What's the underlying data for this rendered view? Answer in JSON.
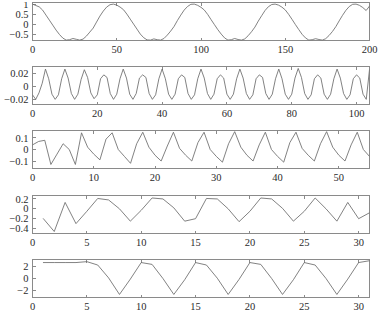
{
  "figure": {
    "title": "",
    "background_color": "#ffffff",
    "line_color": "#6b6b6b",
    "axis_color": "#8a8a8a",
    "subplot_count": 5
  },
  "chart_data": [
    {
      "type": "line",
      "title": "",
      "xlabel": "",
      "ylabel": "",
      "grid": false,
      "legend": null,
      "xlim": [
        0,
        200
      ],
      "ylim": [
        -0.82,
        1.08
      ],
      "xticks": [
        0,
        50,
        100,
        150,
        200
      ],
      "xticklabels": [
        "0",
        "50",
        "100",
        "150",
        "200"
      ],
      "yticks": [
        1,
        0.5,
        0,
        -0.5
      ],
      "yticklabels": [
        "1",
        "0.5",
        "0",
        "-0.5"
      ],
      "x": [
        0,
        2,
        4,
        6,
        8,
        10,
        12,
        14,
        16,
        18,
        20,
        22,
        24,
        26,
        28,
        30,
        32,
        34,
        36,
        38,
        40,
        42,
        44,
        46,
        48,
        50,
        52,
        54,
        56,
        58,
        60,
        62,
        64,
        66,
        68,
        70,
        72,
        74,
        76,
        78,
        80,
        82,
        84,
        86,
        88,
        90,
        92,
        94,
        96,
        98,
        100,
        102,
        104,
        106,
        108,
        110,
        112,
        114,
        116,
        118,
        120,
        122,
        124,
        126,
        128,
        130,
        132,
        134,
        136,
        138,
        140,
        142,
        144,
        146,
        148,
        150,
        152,
        154,
        156,
        158,
        160,
        162,
        164,
        166,
        168,
        170,
        172,
        174,
        176,
        178,
        180,
        182,
        184,
        186,
        188,
        190,
        192,
        194,
        196,
        198,
        200
      ],
      "values": [
        1.0,
        0.93,
        0.86,
        0.7,
        0.45,
        0.2,
        -0.05,
        -0.3,
        -0.52,
        -0.7,
        -0.8,
        -0.78,
        -0.72,
        -0.76,
        -0.8,
        -0.75,
        -0.6,
        -0.4,
        -0.2,
        0.1,
        0.4,
        0.65,
        0.85,
        0.97,
        1.0,
        0.95,
        0.85,
        0.72,
        0.5,
        0.25,
        0.0,
        -0.25,
        -0.5,
        -0.68,
        -0.79,
        -0.8,
        -0.74,
        -0.78,
        -0.8,
        -0.72,
        -0.55,
        -0.35,
        -0.12,
        0.18,
        0.45,
        0.7,
        0.88,
        0.99,
        1.0,
        0.94,
        0.84,
        0.7,
        0.48,
        0.22,
        -0.03,
        -0.28,
        -0.5,
        -0.69,
        -0.8,
        -0.78,
        -0.72,
        -0.77,
        -0.8,
        -0.74,
        -0.58,
        -0.38,
        -0.15,
        0.15,
        0.42,
        0.68,
        0.87,
        0.98,
        1.0,
        0.95,
        0.85,
        0.71,
        0.49,
        0.24,
        -0.02,
        -0.27,
        -0.51,
        -0.69,
        -0.8,
        -0.78,
        -0.73,
        -0.77,
        -0.8,
        -0.73,
        -0.57,
        -0.37,
        -0.13,
        0.16,
        0.44,
        0.69,
        0.88,
        0.99,
        1.0,
        0.94,
        0.83,
        0.68,
        0.9
      ]
    },
    {
      "type": "line",
      "title": "",
      "xlabel": "",
      "ylabel": "",
      "grid": false,
      "legend": null,
      "xlim": [
        0,
        104
      ],
      "ylim": [
        -0.028,
        0.031
      ],
      "xticks": [
        0,
        20,
        40,
        60,
        80,
        100
      ],
      "xticklabels": [
        "0",
        "20",
        "40",
        "60",
        "80",
        "100"
      ],
      "yticks": [
        0.02,
        0,
        -0.02
      ],
      "yticklabels": [
        "0.02",
        "0",
        "-0.02"
      ],
      "x": [
        0,
        1,
        2,
        3,
        4,
        5,
        6,
        7,
        8,
        9,
        10,
        11,
        12,
        13,
        14,
        15,
        16,
        17,
        18,
        19,
        20,
        21,
        22,
        23,
        24,
        25,
        26,
        27,
        28,
        29,
        30,
        31,
        32,
        33,
        34,
        35,
        36,
        37,
        38,
        39,
        40,
        41,
        42,
        43,
        44,
        45,
        46,
        47,
        48,
        49,
        50,
        51,
        52,
        53,
        54,
        55,
        56,
        57,
        58,
        59,
        60,
        61,
        62,
        63,
        64,
        65,
        66,
        67,
        68,
        69,
        70,
        71,
        72,
        73,
        74,
        75,
        76,
        77,
        78,
        79,
        80,
        81,
        82,
        83,
        84,
        85,
        86,
        87,
        88,
        89,
        90,
        91,
        92,
        93,
        94,
        95,
        96,
        97,
        98,
        99,
        100,
        101,
        102,
        103,
        104
      ],
      "values": [
        -0.013,
        -0.02,
        -0.01,
        0.005,
        0.027,
        0.012,
        -0.012,
        -0.02,
        -0.013,
        0.012,
        0.027,
        0.013,
        -0.011,
        -0.02,
        -0.012,
        0.011,
        0.026,
        0.014,
        -0.01,
        -0.019,
        -0.013,
        0.012,
        0.018,
        0.014,
        -0.011,
        -0.02,
        -0.012,
        0.012,
        0.027,
        0.013,
        -0.012,
        -0.02,
        -0.011,
        0.013,
        0.018,
        0.014,
        -0.011,
        -0.02,
        -0.013,
        0.012,
        0.027,
        0.012,
        -0.012,
        -0.02,
        -0.012,
        0.012,
        0.018,
        0.014,
        -0.011,
        -0.02,
        -0.013,
        0.012,
        0.027,
        0.013,
        -0.011,
        -0.02,
        -0.012,
        0.012,
        0.018,
        0.013,
        -0.012,
        -0.02,
        -0.012,
        0.012,
        0.027,
        0.013,
        -0.011,
        -0.02,
        -0.013,
        0.012,
        0.018,
        0.014,
        -0.011,
        -0.02,
        -0.012,
        0.012,
        0.027,
        0.012,
        -0.012,
        -0.02,
        -0.012,
        0.013,
        0.028,
        0.014,
        -0.011,
        -0.02,
        -0.013,
        0.012,
        0.018,
        0.013,
        -0.012,
        -0.02,
        -0.012,
        0.012,
        0.027,
        0.013,
        -0.011,
        -0.02,
        -0.013,
        0.012,
        0.018,
        0.013,
        -0.012,
        -0.02,
        0.026
      ]
    },
    {
      "type": "line",
      "title": "",
      "xlabel": "",
      "ylabel": "",
      "grid": false,
      "legend": null,
      "xlim": [
        0,
        55
      ],
      "ylim": [
        -0.165,
        0.165
      ],
      "xticks": [
        0,
        10,
        20,
        30,
        40,
        50
      ],
      "xticklabels": [
        "0",
        "10",
        "20",
        "30",
        "40",
        "50"
      ],
      "yticks": [
        0.1,
        0,
        -0.1
      ],
      "yticklabels": [
        "0.1",
        "0",
        "-0.1"
      ],
      "x": [
        0,
        1,
        2,
        3,
        4,
        5,
        6,
        7,
        8,
        9,
        10,
        11,
        12,
        13,
        14,
        15,
        16,
        17,
        18,
        19,
        20,
        21,
        22,
        23,
        24,
        25,
        26,
        27,
        28,
        29,
        30,
        31,
        32,
        33,
        34,
        35,
        36,
        37,
        38,
        39,
        40,
        41,
        42,
        43,
        44,
        45,
        46,
        47,
        48,
        49,
        50,
        51,
        52,
        53,
        54,
        55
      ],
      "values": [
        0.04,
        0.07,
        0.08,
        -0.13,
        -0.04,
        0.05,
        0.0,
        -0.13,
        0.145,
        0.02,
        -0.04,
        -0.09,
        0.09,
        0.145,
        0.0,
        -0.06,
        -0.12,
        0.05,
        0.15,
        0.02,
        -0.05,
        -0.1,
        0.03,
        0.15,
        0.01,
        -0.05,
        -0.1,
        0.06,
        0.15,
        0.0,
        -0.06,
        -0.11,
        0.05,
        0.155,
        0.02,
        -0.05,
        -0.1,
        0.04,
        0.15,
        0.0,
        -0.06,
        -0.11,
        0.06,
        0.15,
        0.01,
        -0.05,
        -0.1,
        0.05,
        0.155,
        0.02,
        -0.05,
        -0.1,
        0.04,
        0.15,
        0.0,
        -0.06
      ]
    },
    {
      "type": "line",
      "title": "",
      "xlabel": "",
      "ylabel": "",
      "grid": false,
      "legend": null,
      "xlim": [
        0,
        31
      ],
      "ylim": [
        -0.5,
        0.27
      ],
      "xticks": [
        0,
        5,
        10,
        15,
        20,
        25,
        30
      ],
      "xticklabels": [
        "0",
        "5",
        "10",
        "15",
        "20",
        "25",
        "30"
      ],
      "yticks": [
        0.2,
        0,
        -0.2,
        -0.4
      ],
      "yticklabels": [
        "0.2",
        "0",
        "-0.2",
        "-0.4"
      ],
      "x": [
        1,
        2,
        3,
        4,
        5,
        6,
        7,
        8,
        9,
        10,
        11,
        12,
        13,
        14,
        15,
        16,
        17,
        18,
        19,
        20,
        21,
        22,
        23,
        24,
        25,
        26,
        27,
        28,
        29,
        30,
        31
      ],
      "values": [
        -0.2,
        -0.46,
        0.13,
        -0.3,
        -0.05,
        0.21,
        0.18,
        0.0,
        -0.25,
        -0.03,
        0.22,
        0.2,
        0.02,
        -0.25,
        -0.2,
        0.21,
        0.2,
        0.0,
        -0.26,
        -0.05,
        0.22,
        0.2,
        0.01,
        -0.25,
        -0.05,
        0.22,
        0.0,
        -0.25,
        0.13,
        -0.2,
        -0.08
      ]
    },
    {
      "type": "line",
      "title": "",
      "xlabel": "",
      "ylabel": "",
      "grid": false,
      "legend": null,
      "xlim": [
        0,
        31
      ],
      "ylim": [
        -3.1,
        3.1
      ],
      "xticks": [
        0,
        5,
        10,
        15,
        20,
        25,
        30
      ],
      "xticklabels": [
        "0",
        "5",
        "10",
        "15",
        "20",
        "25",
        "30"
      ],
      "yticks": [
        2,
        0,
        -2
      ],
      "yticklabels": [
        "2",
        "0",
        "-2"
      ],
      "x": [
        1,
        2,
        3,
        4,
        5,
        6,
        7,
        8,
        9,
        10,
        11,
        12,
        13,
        14,
        15,
        16,
        17,
        18,
        19,
        20,
        21,
        22,
        23,
        24,
        25,
        26,
        27,
        28,
        29,
        30,
        31
      ],
      "values": [
        2.6,
        2.6,
        2.6,
        2.6,
        2.75,
        2.2,
        0.1,
        -2.6,
        -0.1,
        2.6,
        2.3,
        0.0,
        -2.6,
        -0.2,
        2.6,
        2.2,
        0.05,
        -2.6,
        -0.15,
        2.6,
        2.3,
        0.0,
        -2.6,
        -0.2,
        2.6,
        2.2,
        0.0,
        -2.6,
        -0.1,
        2.6,
        2.9
      ]
    }
  ]
}
